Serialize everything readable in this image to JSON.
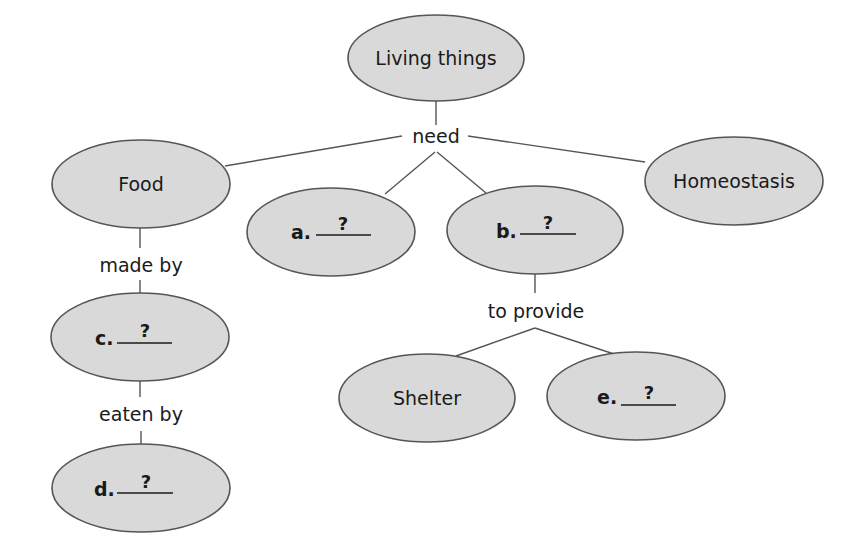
{
  "diagram": {
    "type": "concept-map",
    "nodes": {
      "root": {
        "label": "Living things"
      },
      "food": {
        "label": "Food"
      },
      "a": {
        "letter": "a.",
        "blank": "?"
      },
      "b": {
        "letter": "b.",
        "blank": "?"
      },
      "homeostasis": {
        "label": "Homeostasis"
      },
      "c": {
        "letter": "c.",
        "blank": "?"
      },
      "d": {
        "letter": "d.",
        "blank": "?"
      },
      "shelter": {
        "label": "Shelter"
      },
      "e": {
        "letter": "e.",
        "blank": "?"
      }
    },
    "links": {
      "need": "need",
      "made_by": "made by",
      "eaten_by": "eaten by",
      "to_provide": "to provide"
    },
    "colors": {
      "node_fill": "#d9d9d9",
      "node_stroke": "#555555",
      "text": "#1a1a1a"
    }
  }
}
